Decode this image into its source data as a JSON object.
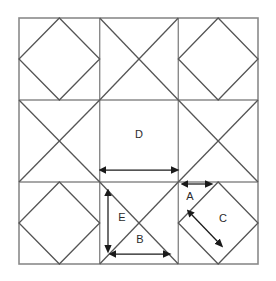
{
  "figure": {
    "background_color": "#ffffff",
    "line_color": "#555555",
    "outline_color": "#888888",
    "arrow_color": "#1a1a1a",
    "label_color": "#2b2b2b"
  },
  "geometry": {
    "outer_square": {
      "x": 19,
      "y": 18,
      "width": 239,
      "height": 246
    },
    "grid": {
      "rows": 3,
      "cols": 3
    },
    "cell_patterns": [
      [
        "diamond",
        "cross",
        "diamond"
      ],
      [
        "cross",
        "plain",
        "cross"
      ],
      [
        "diamond",
        "cross",
        "diamond"
      ]
    ]
  },
  "labels": [
    {
      "id": "label-a",
      "text": "A",
      "x": 190,
      "y": 196,
      "measures": "short horizontal segment at top of bottom-right cell"
    },
    {
      "id": "label-b",
      "text": "B",
      "x": 140,
      "y": 240,
      "measures": "horizontal half-width at base of bottom-middle cell"
    },
    {
      "id": "label-c",
      "text": "C",
      "x": 222,
      "y": 219,
      "measures": "diamond in bottom-right cell"
    },
    {
      "id": "label-d",
      "text": "D",
      "x": 139,
      "y": 135,
      "measures": "plain center cell"
    },
    {
      "id": "label-e",
      "text": "E",
      "x": 122,
      "y": 218,
      "measures": "vertical height of bottom-middle cell"
    }
  ],
  "arrows": [
    {
      "id": "arrow-d",
      "label": "D",
      "orientation": "horizontal",
      "double_headed": true,
      "x1": 106,
      "y1": 170,
      "x2": 172,
      "y2": 170
    },
    {
      "id": "arrow-e",
      "label": "E",
      "orientation": "vertical",
      "double_headed": true,
      "x1": 108,
      "y1": 196,
      "x2": 108,
      "y2": 246
    },
    {
      "id": "arrow-b",
      "label": "B",
      "orientation": "horizontal",
      "double_headed": true,
      "x1": 116,
      "y1": 254,
      "x2": 164,
      "y2": 254
    },
    {
      "id": "arrow-a",
      "label": "A",
      "orientation": "horizontal",
      "double_headed": true,
      "x1": 188,
      "y1": 184,
      "x2": 207,
      "y2": 184
    },
    {
      "id": "arrow-c",
      "label": "C",
      "orientation": "diagonal",
      "double_headed": true,
      "x1": 192,
      "y1": 215,
      "x2": 219,
      "y2": 243
    }
  ]
}
